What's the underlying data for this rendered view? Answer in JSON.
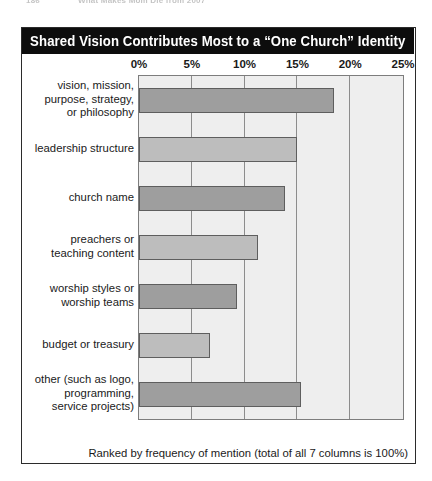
{
  "running_head": {
    "page_number": "186",
    "book_title": "What Makes Mom Die from 2007"
  },
  "figure": {
    "title": "Shared Vision Contributes Most to a “One Church” Identity",
    "footnote": "Ranked by frequency of mention (total of all 7 columns is 100%)"
  },
  "colors": {
    "title_bar_bg": "#0d0d0d",
    "title_text": "#ffffff",
    "plot_bg": "#eeeeee",
    "gridline": "#8c8c8c",
    "bar_dark": "#9e9e9e",
    "bar_light": "#bdbdbd",
    "bar_border": "#5e5e5e",
    "frame": "#2b2b2b"
  },
  "chart_data": {
    "type": "bar",
    "orientation": "horizontal",
    "title": "Shared Vision Contributes Most to a “One Church” Identity",
    "xlabel": "",
    "ylabel": "",
    "xlim": [
      0,
      25
    ],
    "xticks": [
      0,
      5,
      10,
      15,
      20,
      25
    ],
    "xtick_labels": [
      "0%",
      "5%",
      "10%",
      "15%",
      "20%",
      "25%"
    ],
    "grid": true,
    "legend": false,
    "annotation": "Ranked by frequency of mention (total of all 7 columns is 100%)",
    "categories": [
      "vision, mission, purpose, strategy, or philosophy",
      "leadership structure",
      "church name",
      "preachers or teaching content",
      "worship styles or worship teams",
      "budget or treasury",
      "other (such as logo, programming, service projects)"
    ],
    "category_lines": [
      [
        "vision, mission,",
        "purpose, strategy,",
        "or philosophy"
      ],
      [
        "leadership structure"
      ],
      [
        "church name"
      ],
      [
        "preachers or",
        "teaching content"
      ],
      [
        "worship styles or",
        "worship teams"
      ],
      [
        "budget or treasury"
      ],
      [
        "other (such as logo,",
        "programming,",
        "service projects)"
      ]
    ],
    "values": [
      18.5,
      15.0,
      13.8,
      11.3,
      9.3,
      6.7,
      15.3
    ],
    "bar_shades": [
      "dark",
      "light",
      "dark",
      "light",
      "dark",
      "light",
      "dark"
    ]
  }
}
